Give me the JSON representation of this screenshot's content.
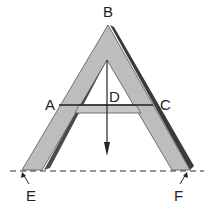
{
  "figure": {
    "labels": {
      "apex": "B",
      "left_crossbar_point": "A",
      "right_crossbar_point": "C",
      "crossbar_midpoint": "D",
      "left_foot": "E",
      "right_foot": "F"
    },
    "colors": {
      "frame_fill": "#bdbdbd",
      "frame_shadow": "#3a3a3a",
      "line": "#222222",
      "background": "#ffffff"
    },
    "elements": [
      "A-shaped wooden frame",
      "horizontal crossbar AC",
      "plumb line hanging from inner apex with bob",
      "dashed ground line through feet E and F"
    ]
  }
}
